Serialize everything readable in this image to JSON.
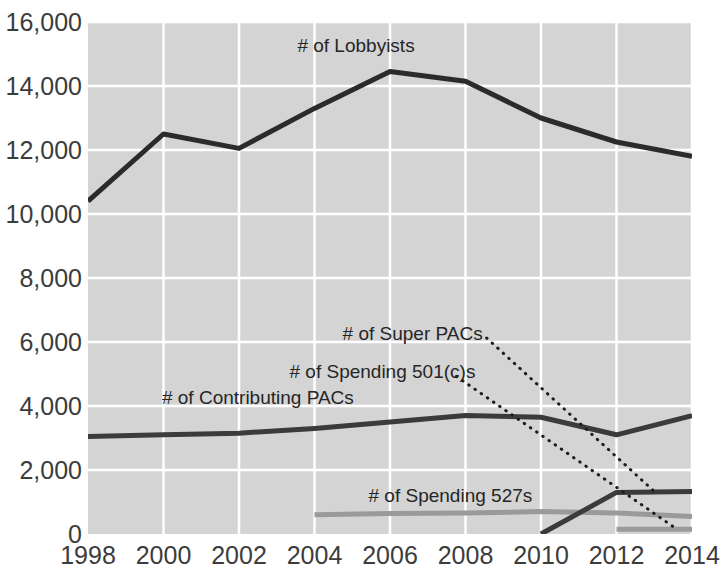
{
  "chart_data": {
    "type": "line",
    "title": "",
    "subtitle": "",
    "xlabel": "",
    "ylabel": "",
    "x": [
      1998,
      2000,
      2002,
      2004,
      2006,
      2008,
      2010,
      2012,
      2014
    ],
    "xtick_labels": [
      "1998",
      "2000",
      "2002",
      "2004",
      "2006",
      "2008",
      "2010",
      "2012",
      "2014"
    ],
    "ytick_labels": [
      "0",
      "2,000",
      "4,000",
      "6,000",
      "8,000",
      "10,000",
      "12,000",
      "14,000",
      "16,000"
    ],
    "ytick_values": [
      0,
      2000,
      4000,
      6000,
      8000,
      10000,
      12000,
      14000,
      16000
    ],
    "xlim": [
      1998,
      2014
    ],
    "ylim": [
      0,
      16000
    ],
    "grid": true,
    "grid_color": "#ffffff",
    "plot_background": "#d4d4d4",
    "legend_position": "inline-annotations",
    "series": [
      {
        "name": "# of Lobbyists",
        "color": "#2b2b2b",
        "style": "solid",
        "width": 5,
        "x": [
          1998,
          2000,
          2002,
          2004,
          2006,
          2008,
          2010,
          2012,
          2014
        ],
        "values": [
          10400,
          12500,
          12050,
          13300,
          14450,
          14150,
          13000,
          12250,
          11800
        ],
        "label_x": 2005.1,
        "label_y": 15250
      },
      {
        "name": "# of Contributing PACs",
        "color": "#3b3b3b",
        "style": "solid",
        "width": 5,
        "x": [
          1998,
          2000,
          2002,
          2004,
          2006,
          2008,
          2010,
          2012,
          2014
        ],
        "values": [
          3050,
          3100,
          3150,
          3300,
          3500,
          3700,
          3650,
          3100,
          3700
        ],
        "label_x": 2002.5,
        "label_y": 4250
      },
      {
        "name": "# of Spending 527s",
        "color": "#9a9a9a",
        "style": "solid",
        "width": 5,
        "x": [
          2004,
          2006,
          2008,
          2010,
          2012,
          2014
        ],
        "values": [
          600,
          640,
          660,
          700,
          660,
          550
        ],
        "label_x": 2007.6,
        "label_y": 1200
      },
      {
        "name": "# of Super PACs",
        "color": "#3b3b3b",
        "style": "solid",
        "width": 5,
        "x": [
          2010,
          2012,
          2014
        ],
        "values": [
          0,
          1300,
          1330
        ],
        "label_x": 2006.6,
        "label_y": 6250,
        "leader_to_x": 2013.0,
        "leader_to_y": 1330
      },
      {
        "name": "# of Spending 501(c)s",
        "color": "#9a9a9a",
        "style": "solid",
        "width": 5,
        "x": [
          2012,
          2014
        ],
        "values": [
          150,
          150
        ],
        "label_x": 2005.8,
        "label_y": 5050,
        "leader_to_x": 2013.6,
        "leader_to_y": 150
      }
    ]
  }
}
